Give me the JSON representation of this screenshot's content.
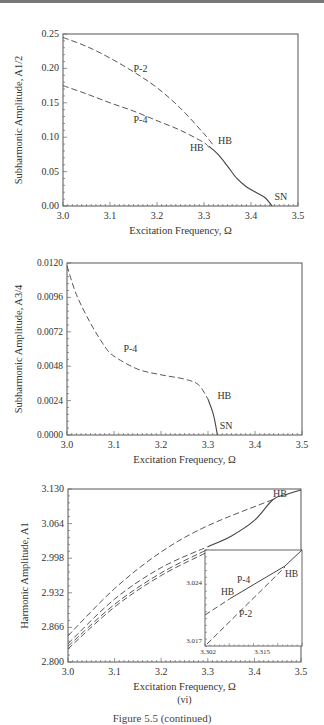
{
  "caption": "Figure 5.5 (continued)",
  "chart_data": [
    {
      "type": "line",
      "panel": "(iv)",
      "xlabel": "Excitation Frequency, Ω",
      "ylabel": "Subharmonic Amplitude, A1/2",
      "xlim": [
        3.0,
        3.5
      ],
      "ylim": [
        0.0,
        0.25
      ],
      "xticks": [
        "3.0",
        "3.1",
        "3.2",
        "3.3",
        "3.4",
        "3.5"
      ],
      "yticks": [
        "0.00",
        "0.05",
        "0.10",
        "0.15",
        "0.20",
        "0.25"
      ],
      "series": [
        {
          "name": "P-2",
          "style": "dashed",
          "x": [
            3.0,
            3.05,
            3.1,
            3.15,
            3.2,
            3.25,
            3.3,
            3.32
          ],
          "y": [
            0.245,
            0.232,
            0.215,
            0.195,
            0.172,
            0.142,
            0.105,
            0.088
          ]
        },
        {
          "name": "P-4",
          "style": "dashed",
          "x": [
            3.0,
            3.05,
            3.1,
            3.15,
            3.2,
            3.25,
            3.3,
            3.31
          ],
          "y": [
            0.175,
            0.163,
            0.15,
            0.138,
            0.124,
            0.11,
            0.092,
            0.085
          ]
        },
        {
          "name": "stable",
          "style": "solid",
          "x": [
            3.31,
            3.33,
            3.35,
            3.37,
            3.39,
            3.41,
            3.43,
            3.445
          ],
          "y": [
            0.087,
            0.075,
            0.058,
            0.04,
            0.028,
            0.02,
            0.012,
            0.0
          ]
        }
      ],
      "annotations": [
        {
          "text": "P-2",
          "x": 3.15,
          "y": 0.195
        },
        {
          "text": "P-4",
          "x": 3.15,
          "y": 0.12
        },
        {
          "text": "HB",
          "x": 3.33,
          "y": 0.09
        },
        {
          "text": "HB",
          "x": 3.27,
          "y": 0.08
        },
        {
          "text": "SN",
          "x": 3.45,
          "y": 0.008
        }
      ]
    },
    {
      "type": "line",
      "panel": "(v)",
      "xlabel": "Excitation Frequency, Ω",
      "ylabel": "Subharmonic Amplitude, A3/4",
      "xlim": [
        3.0,
        3.5
      ],
      "ylim": [
        0.0,
        0.012
      ],
      "xticks": [
        "3.0",
        "3.1",
        "3.2",
        "3.3",
        "3.4",
        "3.5"
      ],
      "yticks": [
        "0.0000",
        "0.0024",
        "0.0048",
        "0.0072",
        "0.0096",
        "0.0120"
      ],
      "series": [
        {
          "name": "P-4",
          "style": "dashed",
          "x": [
            3.0,
            3.02,
            3.05,
            3.08,
            3.1,
            3.15,
            3.2,
            3.25,
            3.28,
            3.3
          ],
          "y": [
            0.0118,
            0.0098,
            0.0078,
            0.0062,
            0.0055,
            0.0046,
            0.0042,
            0.0039,
            0.0035,
            0.0025
          ]
        },
        {
          "name": "stable",
          "style": "solid",
          "x": [
            3.3,
            3.31,
            3.315,
            3.32
          ],
          "y": [
            0.0025,
            0.0016,
            0.0009,
            0.0
          ]
        }
      ],
      "annotations": [
        {
          "text": "P-4",
          "x": 3.12,
          "y": 0.0058
        },
        {
          "text": "HB",
          "x": 3.32,
          "y": 0.0025
        },
        {
          "text": "SN",
          "x": 3.325,
          "y": 0.0004
        }
      ]
    },
    {
      "type": "line",
      "panel": "(vi)",
      "xlabel": "Excitation Frequency, Ω",
      "ylabel": "Harmonic Amplitude, A1",
      "xlim": [
        3.0,
        3.5
      ],
      "ylim": [
        2.8,
        3.13
      ],
      "xticks": [
        "3.0",
        "3.1",
        "3.2",
        "3.3",
        "3.4",
        "3.5"
      ],
      "yticks": [
        "2.800",
        "2.866",
        "2.932",
        "2.998",
        "3.064",
        "3.130"
      ],
      "series": [
        {
          "name": "upper dashed",
          "style": "dashed",
          "x": [
            3.0,
            3.1,
            3.2,
            3.3,
            3.44
          ],
          "y": [
            2.85,
            2.94,
            3.01,
            3.06,
            3.11
          ]
        },
        {
          "name": "P-4",
          "style": "dashed",
          "x": [
            3.0,
            3.1,
            3.2,
            3.3
          ],
          "y": [
            2.835,
            2.92,
            2.98,
            3.02
          ]
        },
        {
          "name": "P-2",
          "style": "dashed",
          "x": [
            3.0,
            3.1,
            3.2,
            3.3
          ],
          "y": [
            2.83,
            2.91,
            2.97,
            3.015
          ]
        },
        {
          "name": "lower dashed",
          "style": "dashed",
          "x": [
            3.0,
            3.1,
            3.2,
            3.3
          ],
          "y": [
            2.825,
            2.905,
            2.965,
            3.01
          ]
        },
        {
          "name": "stable",
          "style": "solid",
          "x": [
            3.3,
            3.35,
            3.4,
            3.44,
            3.47,
            3.5
          ],
          "y": [
            3.02,
            3.04,
            3.07,
            3.11,
            3.12,
            3.128
          ]
        }
      ],
      "annotations": [
        {
          "text": "HB",
          "x": 3.44,
          "y": 3.115
        }
      ],
      "inset": {
        "xticks": [
          "3.302",
          "3.315"
        ],
        "yticks": [
          "3.017",
          "3.024"
        ],
        "annotations": [
          "P-4",
          "HB",
          "HB",
          "P-2"
        ]
      }
    }
  ]
}
